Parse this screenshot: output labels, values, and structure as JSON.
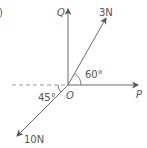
{
  "figure": {
    "part_label": ")",
    "origin_label": "O",
    "axes": {
      "horizontal": {
        "label": "P"
      },
      "vertical": {
        "label": "Q"
      }
    },
    "forces": [
      {
        "label": "3N",
        "angle_label": "60°",
        "angle_reference": "OP"
      },
      {
        "label": "10N",
        "angle_label": "45°",
        "angle_reference": "negative OP (dashed)"
      }
    ],
    "colors": {
      "line": "#6b6b6b",
      "text": "#555555",
      "dashed": "#9a9a9a"
    }
  }
}
